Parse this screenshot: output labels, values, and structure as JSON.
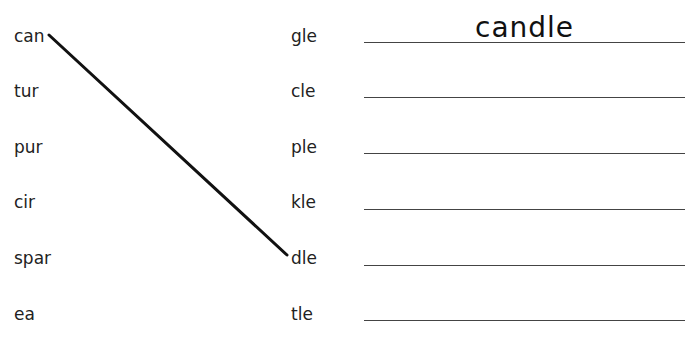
{
  "worksheet": {
    "left_parts": [
      "can",
      "tur",
      "pur",
      "cir",
      "spar",
      "ea"
    ],
    "right_parts": [
      "gle",
      "cle",
      "ple",
      "kle",
      "dle",
      "tle"
    ],
    "answers": [
      "candle",
      "",
      "",
      "",
      "",
      ""
    ],
    "example_connection": {
      "from": "can",
      "to": "dle"
    }
  }
}
